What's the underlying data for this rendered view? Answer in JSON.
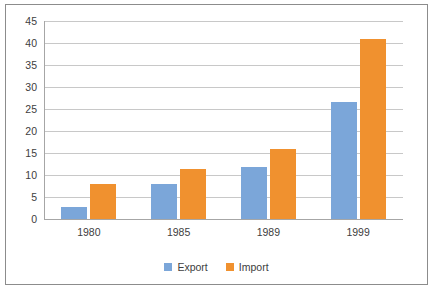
{
  "chart_data": {
    "type": "bar",
    "title": "",
    "subtitle": "",
    "xlabel": "",
    "ylabel": "",
    "categories": [
      "1980",
      "1985",
      "1989",
      "1999"
    ],
    "series": [
      {
        "name": "Export",
        "color": "#7BA6D9",
        "values": [
          2.8,
          8.0,
          11.8,
          26.6
        ]
      },
      {
        "name": "Import",
        "color": "#F0912F",
        "values": [
          8.0,
          11.3,
          15.9,
          40.8
        ]
      }
    ],
    "ylim": [
      0,
      45
    ],
    "ytick_labels": [
      "0",
      "5",
      "10",
      "15",
      "20",
      "25",
      "30",
      "35",
      "40",
      "45"
    ],
    "ytick_values": [
      0,
      5,
      10,
      15,
      20,
      25,
      30,
      35,
      40,
      45
    ],
    "grid": true,
    "grid_color": "#c8c8c8",
    "legend_position": "bottom",
    "legend": [
      "Export",
      "Import"
    ],
    "plot_background": "#ffffff",
    "border_color": "#8c8c8c"
  }
}
